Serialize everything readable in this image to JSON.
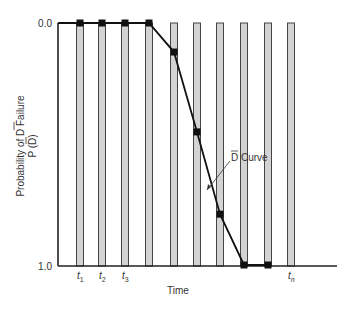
{
  "chart_data": {
    "type": "line",
    "title": "",
    "xlabel": "Time",
    "ylabel_line1": "Probability of D Failure",
    "ylabel_line2": "P (D)",
    "ylabel_overbar_char": "D",
    "y_ticks": [
      "0.0",
      "1.0"
    ],
    "ylim": [
      0.0,
      1.0
    ],
    "y_axis_inverted": true,
    "x_tick_labels": [
      {
        "base": "t",
        "sub": "1",
        "bar_index": 0
      },
      {
        "base": "t",
        "sub": "2",
        "bar_index": 1
      },
      {
        "base": "t",
        "sub": "3",
        "bar_index": 2
      },
      {
        "base": "t",
        "sub": "n",
        "bar_index": 9
      }
    ],
    "bars_count": 10,
    "series": [
      {
        "name": "D Curve",
        "annotation": "D Curve",
        "x_index": [
          0,
          1,
          2,
          3,
          4,
          5,
          6,
          7,
          8
        ],
        "values": [
          0.0,
          0.0,
          0.0,
          0.0,
          0.12,
          0.45,
          0.79,
          1.0,
          1.0
        ]
      }
    ],
    "grid": false,
    "legend": "annotation-arrow"
  },
  "colors": {
    "bar_fill": "#d3d3d3",
    "bar_stroke": "#444444",
    "line": "#111111",
    "axis": "#222222"
  }
}
